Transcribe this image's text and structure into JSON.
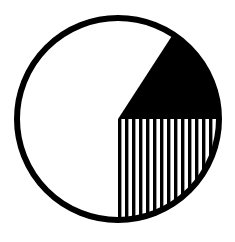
{
  "figure": {
    "title": "Sectored circle diagram",
    "type": "pie",
    "width": 235,
    "height": 242,
    "background_color": "#ffffff"
  },
  "circle": {
    "name": "outline-circle",
    "center_x": 118,
    "center_y": 119,
    "radius": 101,
    "stroke_color": "#000000",
    "stroke_width": 6,
    "fill_color": "#ffffff"
  },
  "chart_data": {
    "type": "pie",
    "title": "Sectored circle diagram",
    "xlabel": "",
    "ylabel": "",
    "center": [
      118,
      119
    ],
    "radius": 104,
    "total_degrees": 360,
    "categories": [
      "solid-black-wedge",
      "vertical-striped-sector",
      "blank-white-sector"
    ],
    "values": [
      57,
      90,
      213
    ],
    "labels": [
      "",
      "",
      ""
    ],
    "series": [
      {
        "name": "sectors",
        "values": [
          57,
          90,
          213
        ]
      }
    ],
    "slices": [
      {
        "name": "solid-black-wedge",
        "fill": "solid",
        "color": "#000000",
        "start_angle_deg": -57,
        "end_angle_deg": 0,
        "sweep_deg": 57,
        "fraction": 0.158
      },
      {
        "name": "vertical-striped-sector",
        "fill": "vertical-stripes",
        "color": "#000000",
        "start_angle_deg": 0,
        "end_angle_deg": 90,
        "sweep_deg": 90,
        "fraction": 0.25
      },
      {
        "name": "blank-white-sector",
        "fill": "none",
        "color": "#ffffff",
        "start_angle_deg": 90,
        "end_angle_deg": 303,
        "sweep_deg": 213,
        "fraction": 0.592
      }
    ],
    "legend": [],
    "grid": false,
    "axis_visible": false
  },
  "hatch": {
    "name": "vertical-stripe-pattern",
    "orientation": "vertical",
    "stripe_count": 15,
    "stripe_width": 3.4,
    "gap_width": 3.6,
    "period": 7,
    "color": "#000000"
  },
  "geometry": {
    "wedge_apex": [
      118,
      119
    ],
    "wedge_arc_start": [
      170,
      40
    ],
    "wedge_arc_end": [
      219,
      119
    ],
    "stripe_sector_top_right": [
      219,
      119
    ],
    "stripe_sector_bottom": [
      118,
      220
    ]
  }
}
